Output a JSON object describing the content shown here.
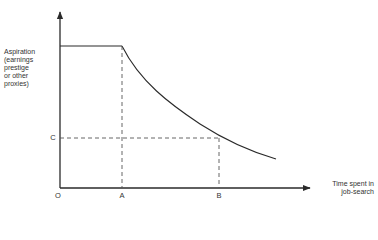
{
  "diagram": {
    "type": "line-diagram",
    "y_axis_label_lines": [
      "Aspiration",
      "(earnings",
      "prestige",
      "or other",
      "proxies)"
    ],
    "x_axis_label_lines": [
      "Time spent in",
      "job-search"
    ],
    "origin_label": "O",
    "x_markers": [
      "A",
      "B"
    ],
    "y_markers": [
      "C"
    ],
    "curve_description": "Aspiration constant from O to A, then declines convexly with time spent in job-search; at time B aspiration equals C",
    "colors": {
      "line": "#2a2a2a",
      "background": "#ffffff"
    }
  }
}
